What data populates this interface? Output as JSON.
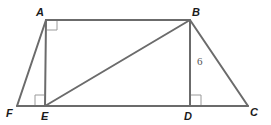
{
  "diagram": {
    "points": {
      "A": {
        "label": "A",
        "x": 46,
        "y": 20
      },
      "B": {
        "label": "B",
        "x": 190,
        "y": 20
      },
      "C": {
        "label": "C",
        "x": 248,
        "y": 106
      },
      "D": {
        "label": "D",
        "x": 190,
        "y": 106
      },
      "E": {
        "label": "E",
        "x": 45,
        "y": 106
      },
      "F": {
        "label": "F",
        "x": 17,
        "y": 106
      }
    },
    "segments": [
      "AB",
      "FC",
      "AF",
      "AE",
      "BE",
      "BD",
      "BC"
    ],
    "right_angles": [
      "A (angle EAB)",
      "E (angle AEF)",
      "D (angle BDC)"
    ],
    "measurements": {
      "BD": "6"
    },
    "colors": {
      "line": "#6b6b6b",
      "label": "#1a1a1a"
    }
  }
}
